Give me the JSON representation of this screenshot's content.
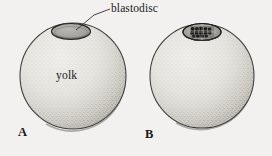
{
  "figure": {
    "title_label": "blastodisc",
    "yolk_label": "yolk",
    "panels": [
      {
        "letter": "A",
        "caption": ""
      },
      {
        "letter": "B",
        "caption": ""
      }
    ],
    "colors": {
      "background": "#f2f1ef",
      "yolk_fill": "#e8e7e2",
      "yolk_shade": "#b9b7b0",
      "outline": "#2b2b2b",
      "blastodisc_fill": "#a9a7a1",
      "blastodisc_outline": "#262626",
      "cleavage_cell": "#1b1b1b",
      "text": "#1a1a1a"
    }
  },
  "diagram_data": {
    "type": "biological-illustration",
    "subject": "telolecithal egg cleavage",
    "structures": [
      {
        "name": "blastodisc",
        "panel": "A",
        "state": "uncleaved"
      },
      {
        "name": "yolk",
        "panel": "A",
        "state": "intact"
      },
      {
        "name": "blastodisc",
        "panel": "B",
        "state": "cleaved-into-cells"
      },
      {
        "name": "yolk",
        "panel": "B",
        "state": "intact"
      }
    ],
    "leader_lines": [
      {
        "from_label": "blastodisc",
        "to_panel": "A"
      }
    ]
  }
}
